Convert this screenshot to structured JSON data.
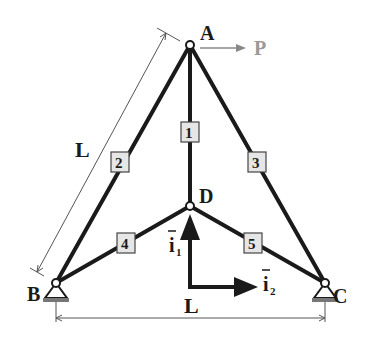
{
  "diagram": {
    "type": "truss",
    "nodes": {
      "A": {
        "label": "A",
        "x": 190,
        "y": 45
      },
      "B": {
        "label": "B",
        "x": 56,
        "y": 283
      },
      "C": {
        "label": "C",
        "x": 325,
        "y": 283
      },
      "D": {
        "label": "D",
        "x": 190,
        "y": 206
      }
    },
    "members": [
      {
        "id": "1",
        "label": "1",
        "from": "A",
        "to": "D"
      },
      {
        "id": "2",
        "label": "2",
        "from": "A",
        "to": "B"
      },
      {
        "id": "3",
        "label": "3",
        "from": "A",
        "to": "C"
      },
      {
        "id": "4",
        "label": "4",
        "from": "B",
        "to": "D"
      },
      {
        "id": "5",
        "label": "5",
        "from": "D",
        "to": "C"
      }
    ],
    "load": {
      "label": "P",
      "node": "A",
      "direction": "right"
    },
    "dimensions": [
      {
        "label": "L",
        "between": [
          "A",
          "B"
        ]
      },
      {
        "label": "L",
        "between": [
          "B",
          "C"
        ]
      }
    ],
    "unit_vectors": {
      "i1": {
        "label": "i",
        "subscript": "1",
        "direction": "up"
      },
      "i2": {
        "label": "i",
        "subscript": "2",
        "direction": "right"
      }
    },
    "supports": [
      {
        "node": "B",
        "type": "pin"
      },
      {
        "node": "C",
        "type": "pin"
      }
    ],
    "colors": {
      "members": "#1a1a1a",
      "dimension": "#555555",
      "load": "#888888",
      "box_fill": "#e6e6e6"
    }
  }
}
